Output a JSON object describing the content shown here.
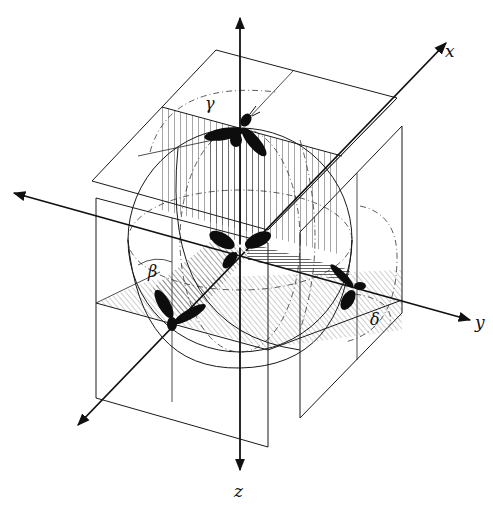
{
  "diagram": {
    "type": "3d-coordinate-schematic",
    "colors": {
      "ink": "#111111",
      "background": "#ffffff"
    },
    "axes": [
      {
        "id": "x",
        "label": "x"
      },
      {
        "id": "y",
        "label": "y"
      },
      {
        "id": "z",
        "label": "z"
      }
    ],
    "angles": [
      {
        "id": "gamma",
        "label": "γ",
        "plane": "top horizontal plane"
      },
      {
        "id": "beta",
        "label": "β",
        "plane": "front vertical plane"
      },
      {
        "id": "delta",
        "label": "δ",
        "plane": "right vertical plane"
      }
    ],
    "elements": {
      "sphere": "central sphere with dashed great circles",
      "insect_icons": [
        "insect-top",
        "insect-center",
        "insect-left",
        "insect-right"
      ],
      "planes": [
        "top-plane",
        "left-front-plane",
        "right-side-plane",
        "horizontal-mid-plane"
      ]
    }
  }
}
